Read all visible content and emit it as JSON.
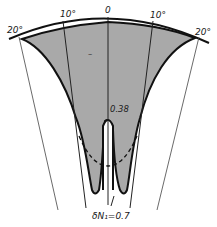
{
  "diagram": {
    "type": "angular sector plot",
    "angle_labels": {
      "left_20": "20°",
      "left_10": "10°",
      "center": "0",
      "right_10": "10°",
      "right_20": "20°"
    },
    "annotations": {
      "value_038": "0.38",
      "minus_sign": "–",
      "delta_label": "δN₁=0.7"
    },
    "colors": {
      "fill": "#a9a9a9",
      "outline": "#111111",
      "background": "#ffffff",
      "thin_line": "#333333"
    }
  }
}
